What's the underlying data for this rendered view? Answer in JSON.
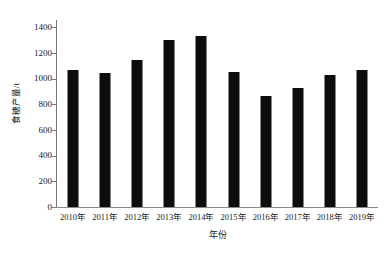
{
  "chart_data": {
    "type": "bar",
    "title": "",
    "subtitle": "",
    "xlabel": "年份",
    "ylabel": "食糖产量/t",
    "categories": [
      "2010年",
      "2011年",
      "2012年",
      "2013年",
      "2014年",
      "2015年",
      "2016年",
      "2017年",
      "2018年",
      "2019年"
    ],
    "values": [
      1065,
      1045,
      1148,
      1300,
      1330,
      1055,
      865,
      930,
      1030,
      1072
    ],
    "series": [
      {
        "name": "食糖产量",
        "values": [
          1065,
          1045,
          1148,
          1300,
          1330,
          1055,
          865,
          930,
          1030,
          1072
        ]
      }
    ],
    "ylim": [
      0,
      1450
    ],
    "yticks": [
      0,
      200,
      400,
      600,
      800,
      1000,
      1200,
      1400
    ],
    "ytick_labels": [
      "0",
      "200",
      "400",
      "600",
      "800",
      "1000",
      "1200",
      "1400"
    ],
    "xtick_labels": [
      "2010年",
      "2011年",
      "2012年",
      "2013年",
      "2014年",
      "2015年",
      "2016年",
      "2017年",
      "2018年",
      "2019年"
    ],
    "grid": false,
    "legend": false,
    "legend_position": "none",
    "bar_color": "#0d0d0d",
    "axis_color": "#7a7a7a",
    "background_color": "#ffffff"
  }
}
